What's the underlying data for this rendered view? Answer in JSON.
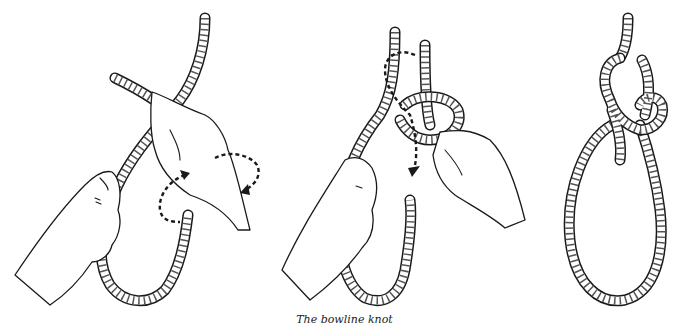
{
  "figure": {
    "caption": "The bowline knot",
    "panels": [
      {
        "step": 1,
        "description": "Overhand loop formed with working end crossing over standing part; dotted arrow shows twisting motion of hand"
      },
      {
        "step": 2,
        "description": "Working end passed up through small loop; dotted arrow shows path around standing part and back down"
      },
      {
        "step": 3,
        "description": "Completed bowline knot with fixed loop"
      }
    ],
    "colors": {
      "ink": "#1a1a1a",
      "background": "#ffffff"
    }
  }
}
